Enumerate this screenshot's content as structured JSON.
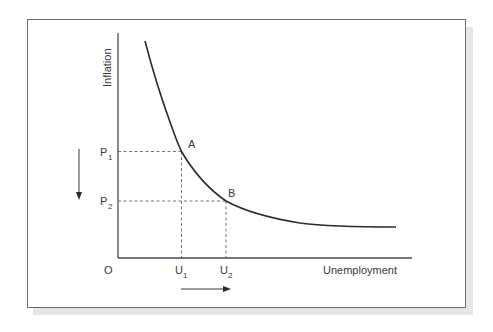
{
  "diagram": {
    "type": "Phillips curve",
    "y_axis_label": "Inflation",
    "x_axis_label": "Unemployment",
    "origin_label": "O",
    "points": [
      {
        "name": "A",
        "label": "A",
        "price_label": "P",
        "price_sub": "1",
        "unemp_label": "U",
        "unemp_sub": "1"
      },
      {
        "name": "B",
        "label": "B",
        "price_label": "P",
        "price_sub": "2",
        "unemp_label": "U",
        "unemp_sub": "2"
      }
    ],
    "arrows": [
      {
        "name": "inflation-decrease",
        "direction": "down"
      },
      {
        "name": "unemployment-increase",
        "direction": "right"
      }
    ],
    "colors": {
      "curve": "#2b2b2b",
      "axis": "#4a4a4a",
      "dashed": "#666666",
      "text": "#3a3a3a",
      "frame": "#6e6e6e",
      "shadow": "#e6e6ea"
    }
  }
}
